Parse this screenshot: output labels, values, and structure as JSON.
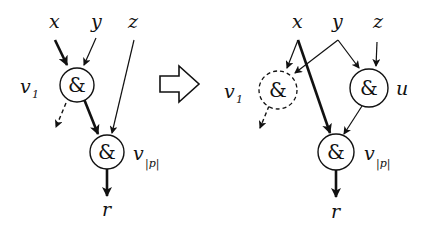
{
  "diagram": {
    "type": "circuit-transformation",
    "transform_arrow": "hollow-right-arrow",
    "left": {
      "inputs": [
        {
          "id": "x",
          "label": "x"
        },
        {
          "id": "y",
          "label": "y"
        },
        {
          "id": "z",
          "label": "z"
        }
      ],
      "gates": [
        {
          "id": "v1",
          "symbol": "&",
          "label": "v",
          "sub": "1",
          "style": "solid"
        },
        {
          "id": "vp",
          "symbol": "&",
          "label": "v",
          "sub": "|p|",
          "style": "solid"
        }
      ],
      "output": {
        "id": "r",
        "label": "r"
      },
      "edges": [
        {
          "from": "x",
          "to": "v1",
          "weight": "bold"
        },
        {
          "from": "y",
          "to": "v1",
          "weight": "thin"
        },
        {
          "from": "z",
          "to": "vp",
          "weight": "thin"
        },
        {
          "from": "v1",
          "to": "vp",
          "weight": "bold"
        },
        {
          "from": "v1",
          "to": "elsewhere",
          "weight": "dashed"
        },
        {
          "from": "vp",
          "to": "r",
          "weight": "bold"
        }
      ]
    },
    "right": {
      "inputs": [
        {
          "id": "x",
          "label": "x"
        },
        {
          "id": "y",
          "label": "y"
        },
        {
          "id": "z",
          "label": "z"
        }
      ],
      "gates": [
        {
          "id": "v1",
          "symbol": "&",
          "label": "v",
          "sub": "1",
          "style": "dashed"
        },
        {
          "id": "u",
          "symbol": "&",
          "label": "u",
          "sub": "",
          "style": "solid"
        },
        {
          "id": "vp",
          "symbol": "&",
          "label": "v",
          "sub": "|p|",
          "style": "solid"
        }
      ],
      "output": {
        "id": "r",
        "label": "r"
      },
      "edges": [
        {
          "from": "x",
          "to": "v1",
          "weight": "thin"
        },
        {
          "from": "y",
          "to": "v1",
          "weight": "thin"
        },
        {
          "from": "x",
          "to": "vp",
          "weight": "bold"
        },
        {
          "from": "y",
          "to": "u",
          "weight": "thin"
        },
        {
          "from": "z",
          "to": "u",
          "weight": "thin"
        },
        {
          "from": "u",
          "to": "vp",
          "weight": "thin"
        },
        {
          "from": "v1",
          "to": "elsewhere",
          "weight": "dashed"
        },
        {
          "from": "vp",
          "to": "r",
          "weight": "bold"
        }
      ]
    }
  }
}
